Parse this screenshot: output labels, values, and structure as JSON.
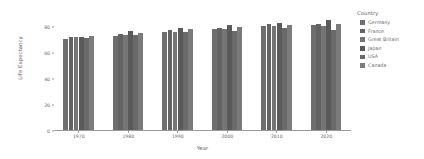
{
  "chart_data": {
    "type": "bar",
    "title": "",
    "xlabel": "Year",
    "ylabel": "Life Expectancy",
    "categories": [
      "1970",
      "1980",
      "1990",
      "2000",
      "2010",
      "2020"
    ],
    "ylim": [
      0,
      88
    ],
    "yticks": [
      0,
      20,
      40,
      60,
      80
    ],
    "ytick_labels": [
      "0",
      "20",
      "40",
      "60",
      "80"
    ],
    "grid": false,
    "legend_title": "Country",
    "legend_position": "right",
    "series": [
      {
        "name": "Germany",
        "color": "#6e6e6e",
        "values": [
          70.6,
          72.6,
          75.3,
          78.0,
          80.0,
          80.9
        ]
      },
      {
        "name": "France",
        "color": "#636363",
        "values": [
          71.7,
          74.1,
          76.9,
          79.1,
          81.7,
          82.2
        ]
      },
      {
        "name": "Great Britain",
        "color": "#757575",
        "values": [
          71.9,
          73.7,
          75.9,
          77.9,
          80.6,
          80.4
        ]
      },
      {
        "name": "Japan",
        "color": "#5a5a5a",
        "values": [
          72.0,
          76.1,
          78.9,
          81.2,
          82.9,
          84.6
        ]
      },
      {
        "name": "USA",
        "color": "#6a6a6a",
        "values": [
          70.8,
          73.7,
          75.4,
          76.8,
          78.5,
          77.0
        ]
      },
      {
        "name": "Canada",
        "color": "#7b7b7b",
        "values": [
          72.7,
          75.2,
          77.6,
          79.2,
          81.2,
          81.7
        ]
      }
    ]
  },
  "axis": {
    "x_title": "Year",
    "y_title": "Life Expectancy"
  },
  "legend": {
    "title": "Country"
  }
}
